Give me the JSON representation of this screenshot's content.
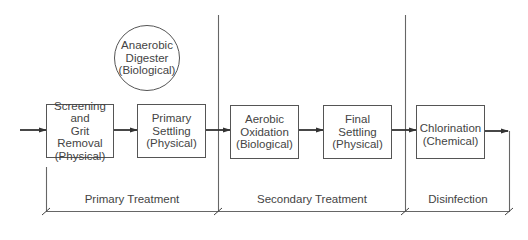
{
  "diagram": {
    "digester": {
      "lines": [
        "Anaerobic",
        "Digester",
        "(Biological)"
      ]
    },
    "units": [
      {
        "id": "screening",
        "lines": [
          "Screening",
          "and",
          "Grit Removal",
          "(Physical)"
        ]
      },
      {
        "id": "primary-settling",
        "lines": [
          "Primary",
          "Settling",
          "(Physical)"
        ]
      },
      {
        "id": "aerobic-oxidation",
        "lines": [
          "Aerobic",
          "Oxidation",
          "(Biological)"
        ]
      },
      {
        "id": "final-settling",
        "lines": [
          "Final",
          "Settling",
          "(Physical)"
        ]
      },
      {
        "id": "chlorination",
        "lines": [
          "Chlorination",
          "(Chemical)"
        ]
      }
    ],
    "stages": [
      {
        "id": "primary",
        "label": "Primary Treatment"
      },
      {
        "id": "secondary",
        "label": "Secondary Treatment"
      },
      {
        "id": "disinfection",
        "label": "Disinfection"
      }
    ],
    "colors": {
      "line": "#555555",
      "text": "#444444"
    }
  }
}
